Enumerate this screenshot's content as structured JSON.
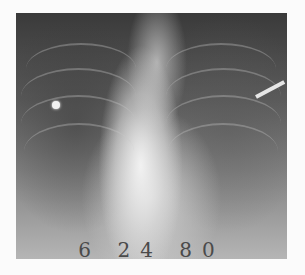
{
  "image": {
    "type": "chest radiograph",
    "description": "Frontal chest X-ray showing enlarged cardiac silhouette and lung fields",
    "handwritten_label": "6 24 80"
  },
  "colors": {
    "background": "#fbfbfb",
    "film_dark": "#3a3a3a",
    "film_light": "#f2f2f2"
  }
}
